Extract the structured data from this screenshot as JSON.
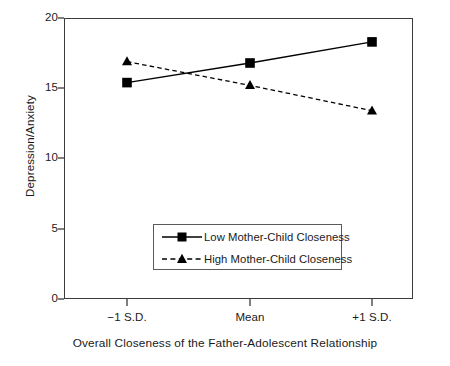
{
  "chart_data": {
    "type": "line",
    "title": "",
    "xlabel": "Overall Closeness of the Father-Adolescent Relationship",
    "ylabel": "Depression/Anxiety",
    "categories": [
      "−1 S.D.",
      "Mean",
      "+1 S.D."
    ],
    "x": [
      0,
      1,
      2
    ],
    "ylim": [
      0,
      20
    ],
    "yticks": [
      0,
      5,
      10,
      15,
      20
    ],
    "ytick_labels": [
      "0",
      "5",
      "10",
      "15",
      "20"
    ],
    "grid": false,
    "legend_position": "lower center",
    "series": [
      {
        "name": "Low Mother-Child Closeness",
        "values": [
          15.4,
          16.8,
          18.3
        ],
        "marker": "square",
        "linestyle": "solid",
        "color": "#000000"
      },
      {
        "name": "High Mother-Child Closeness",
        "values": [
          16.9,
          15.2,
          13.4
        ],
        "marker": "triangle",
        "linestyle": "dashed",
        "color": "#000000"
      }
    ]
  },
  "axes": {
    "y_tick_labels": [
      "20",
      "15",
      "10",
      "5",
      "0"
    ],
    "x_tick_labels": [
      "−1 S.D.",
      "Mean",
      "+1 S.D."
    ],
    "y_axis_title": "Depression/Anxiety",
    "x_axis_title": "Overall Closeness of the Father-Adolescent Relationship"
  },
  "legend": {
    "entries": [
      {
        "label": "Low Mother-Child Closeness",
        "marker": "square-marker",
        "line": "solid-line"
      },
      {
        "label": "High Mother-Child Closeness",
        "marker": "triangle-marker",
        "line": "dashed-line"
      }
    ]
  },
  "colors": {
    "series_stroke": "#000000",
    "frame": "#3b3b3b",
    "text": "#1a1a1a",
    "background": "#ffffff"
  }
}
